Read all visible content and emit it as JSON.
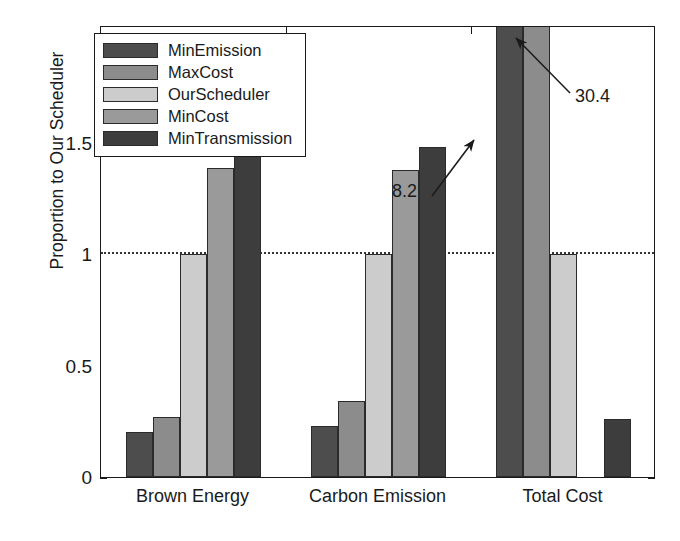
{
  "chart_data": {
    "type": "bar",
    "title": "",
    "xlabel": "",
    "ylabel": "Proportion to Our Scheduler",
    "categories": [
      "Brown Energy",
      "Carbon Emission",
      "Total Cost"
    ],
    "ylim": [
      0,
      2.03
    ],
    "yticks": [
      0,
      0.5,
      1,
      1.5
    ],
    "ytick_labels": [
      "0",
      "0.5",
      "1",
      "1.5"
    ],
    "grid": false,
    "reference_line": 1,
    "legend_position": "upper left",
    "series": [
      {
        "name": "MinEmission",
        "color": "#4d4d4d",
        "values": [
          0.2,
          0.23,
          8.2
        ]
      },
      {
        "name": "MaxCost",
        "color": "#8c8c8c",
        "values": [
          0.27,
          0.34,
          30.4
        ]
      },
      {
        "name": "OurScheduler",
        "color": "#cccccc",
        "values": [
          1.0,
          1.0,
          1.0
        ]
      },
      {
        "name": "MinCost",
        "color": "#9a9a9a",
        "values": [
          1.39,
          1.38,
          0.0
        ]
      },
      {
        "name": "MinTransmission",
        "color": "#3d3d3d",
        "values": [
          1.49,
          1.48,
          0.26
        ]
      }
    ],
    "annotations": [
      {
        "text": "8.2",
        "series": "MinEmission",
        "category": "Total Cost"
      },
      {
        "text": "30.4",
        "series": "MaxCost",
        "category": "Total Cost"
      }
    ]
  },
  "legend": {
    "items": [
      {
        "label": "MinEmission"
      },
      {
        "label": "MaxCost"
      },
      {
        "label": "OurScheduler"
      },
      {
        "label": "MinCost"
      },
      {
        "label": "MinTransmission"
      }
    ]
  }
}
